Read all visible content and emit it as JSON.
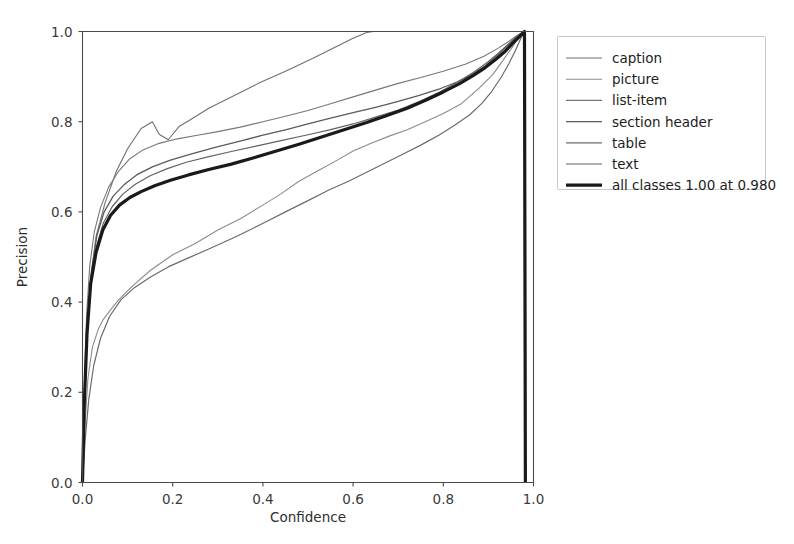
{
  "figure": {
    "background_color": "#ffffff",
    "width": 794,
    "height": 544
  },
  "axes": {
    "x_title": "Confidence",
    "y_title": "Precision",
    "x_ticks": [
      "0.0",
      "0.2",
      "0.4",
      "0.6",
      "0.8",
      "1.0"
    ],
    "y_ticks": [
      "0.0",
      "0.2",
      "0.4",
      "0.6",
      "0.8",
      "1.0"
    ]
  },
  "legend": {
    "entries": [
      {
        "label": "caption",
        "color": "#6f6f6f",
        "width": 1.1
      },
      {
        "label": "picture",
        "color": "#8c8c8c",
        "width": 1.1
      },
      {
        "label": "list-item",
        "color": "#777777",
        "width": 1.1
      },
      {
        "label": "section header",
        "color": "#5a5a5a",
        "width": 1.3
      },
      {
        "label": "table",
        "color": "#6b6b6b",
        "width": 1.2
      },
      {
        "label": "text",
        "color": "#626262",
        "width": 1.2
      },
      {
        "label": "all classes 1.00 at 0.980",
        "color": "#1a1a1a",
        "width": 3.2
      }
    ]
  },
  "chart_data": {
    "type": "line",
    "title": "",
    "xlabel": "Confidence",
    "ylabel": "Precision",
    "xlim": [
      0.0,
      1.0
    ],
    "ylim": [
      0.0,
      1.0
    ],
    "xticks": [
      0.0,
      0.2,
      0.4,
      0.6,
      0.8,
      1.0
    ],
    "yticks": [
      0.0,
      0.2,
      0.4,
      0.6,
      0.8,
      1.0
    ],
    "grid": false,
    "legend_position": "outside-right-top",
    "annotation": "all classes 1.00 at 0.980",
    "series": [
      {
        "name": "caption",
        "color": "#6f6f6f",
        "linewidth": 1.1,
        "x": [
          0.0,
          0.004,
          0.01,
          0.018,
          0.03,
          0.05,
          0.075,
          0.1,
          0.13,
          0.155,
          0.17,
          0.19,
          0.215,
          0.24,
          0.28,
          0.33,
          0.39,
          0.45,
          0.51,
          0.56,
          0.6,
          0.63,
          0.645,
          0.7,
          0.8,
          0.9,
          0.95,
          0.975,
          0.98,
          0.982
        ],
        "y": [
          0.0,
          0.18,
          0.34,
          0.45,
          0.545,
          0.62,
          0.69,
          0.74,
          0.785,
          0.8,
          0.772,
          0.76,
          0.79,
          0.805,
          0.83,
          0.855,
          0.885,
          0.912,
          0.94,
          0.965,
          0.985,
          0.998,
          1.0,
          1.0,
          1.0,
          1.0,
          1.0,
          1.0,
          1.0,
          0.0
        ]
      },
      {
        "name": "picture",
        "color": "#8c8c8c",
        "linewidth": 1.1,
        "x": [
          0.0,
          0.005,
          0.012,
          0.022,
          0.035,
          0.045,
          0.06,
          0.08,
          0.11,
          0.15,
          0.2,
          0.25,
          0.3,
          0.35,
          0.4,
          0.44,
          0.48,
          0.52,
          0.56,
          0.6,
          0.64,
          0.68,
          0.72,
          0.76,
          0.8,
          0.84,
          0.88,
          0.91,
          0.935,
          0.955,
          0.968,
          0.978,
          0.98,
          0.982
        ],
        "y": [
          0.0,
          0.12,
          0.23,
          0.3,
          0.34,
          0.36,
          0.38,
          0.405,
          0.435,
          0.47,
          0.505,
          0.53,
          0.56,
          0.585,
          0.615,
          0.64,
          0.668,
          0.69,
          0.712,
          0.735,
          0.752,
          0.768,
          0.782,
          0.8,
          0.818,
          0.84,
          0.875,
          0.905,
          0.94,
          0.968,
          0.99,
          1.0,
          1.0,
          0.0
        ]
      },
      {
        "name": "list-item",
        "color": "#777777",
        "linewidth": 1.1,
        "x": [
          0.0,
          0.004,
          0.009,
          0.016,
          0.026,
          0.04,
          0.058,
          0.08,
          0.105,
          0.135,
          0.17,
          0.21,
          0.255,
          0.3,
          0.35,
          0.4,
          0.45,
          0.5,
          0.55,
          0.6,
          0.65,
          0.7,
          0.75,
          0.8,
          0.85,
          0.89,
          0.92,
          0.945,
          0.962,
          0.975,
          0.98,
          0.982
        ],
        "y": [
          0.0,
          0.2,
          0.37,
          0.48,
          0.555,
          0.61,
          0.655,
          0.69,
          0.718,
          0.738,
          0.752,
          0.762,
          0.77,
          0.778,
          0.788,
          0.8,
          0.812,
          0.825,
          0.84,
          0.855,
          0.87,
          0.885,
          0.898,
          0.912,
          0.928,
          0.945,
          0.962,
          0.978,
          0.99,
          0.998,
          1.0,
          0.0
        ]
      },
      {
        "name": "section header",
        "color": "#5a5a5a",
        "linewidth": 1.3,
        "x": [
          0.0,
          0.005,
          0.011,
          0.02,
          0.032,
          0.048,
          0.068,
          0.092,
          0.12,
          0.155,
          0.195,
          0.24,
          0.29,
          0.345,
          0.4,
          0.45,
          0.5,
          0.55,
          0.6,
          0.65,
          0.7,
          0.745,
          0.79,
          0.83,
          0.865,
          0.895,
          0.92,
          0.942,
          0.96,
          0.974,
          0.98,
          0.982
        ],
        "y": [
          0.0,
          0.19,
          0.355,
          0.47,
          0.548,
          0.6,
          0.635,
          0.66,
          0.682,
          0.7,
          0.715,
          0.728,
          0.742,
          0.756,
          0.77,
          0.782,
          0.795,
          0.808,
          0.82,
          0.832,
          0.845,
          0.858,
          0.872,
          0.888,
          0.905,
          0.925,
          0.948,
          0.968,
          0.985,
          0.996,
          1.0,
          0.0
        ]
      },
      {
        "name": "table",
        "color": "#6b6b6b",
        "linewidth": 1.2,
        "x": [
          0.0,
          0.006,
          0.014,
          0.025,
          0.04,
          0.06,
          0.085,
          0.115,
          0.15,
          0.19,
          0.235,
          0.285,
          0.34,
          0.395,
          0.45,
          0.5,
          0.545,
          0.59,
          0.63,
          0.67,
          0.71,
          0.75,
          0.79,
          0.825,
          0.858,
          0.885,
          0.908,
          0.928,
          0.945,
          0.96,
          0.972,
          0.98,
          0.982
        ],
        "y": [
          0.0,
          0.095,
          0.185,
          0.26,
          0.32,
          0.368,
          0.405,
          0.432,
          0.455,
          0.478,
          0.498,
          0.52,
          0.545,
          0.572,
          0.6,
          0.625,
          0.648,
          0.668,
          0.688,
          0.708,
          0.728,
          0.748,
          0.77,
          0.792,
          0.815,
          0.84,
          0.868,
          0.898,
          0.928,
          0.958,
          0.985,
          1.0,
          0.0
        ]
      },
      {
        "name": "text",
        "color": "#626262",
        "linewidth": 1.2,
        "x": [
          0.0,
          0.004,
          0.01,
          0.018,
          0.03,
          0.046,
          0.066,
          0.09,
          0.118,
          0.15,
          0.188,
          0.23,
          0.278,
          0.33,
          0.385,
          0.44,
          0.495,
          0.548,
          0.6,
          0.65,
          0.7,
          0.748,
          0.792,
          0.832,
          0.868,
          0.898,
          0.922,
          0.942,
          0.958,
          0.972,
          0.98,
          0.982
        ],
        "y": [
          0.0,
          0.175,
          0.33,
          0.44,
          0.52,
          0.575,
          0.612,
          0.64,
          0.662,
          0.68,
          0.696,
          0.71,
          0.722,
          0.734,
          0.746,
          0.758,
          0.77,
          0.782,
          0.795,
          0.81,
          0.826,
          0.845,
          0.866,
          0.888,
          0.91,
          0.932,
          0.952,
          0.97,
          0.985,
          0.996,
          1.0,
          0.0
        ]
      },
      {
        "name": "all classes 1.00 at 0.980",
        "color": "#1a1a1a",
        "linewidth": 3.2,
        "x": [
          0.0,
          0.004,
          0.01,
          0.018,
          0.03,
          0.045,
          0.062,
          0.082,
          0.105,
          0.13,
          0.16,
          0.195,
          0.235,
          0.28,
          0.33,
          0.38,
          0.43,
          0.48,
          0.53,
          0.58,
          0.63,
          0.675,
          0.72,
          0.762,
          0.8,
          0.835,
          0.866,
          0.893,
          0.916,
          0.936,
          0.952,
          0.966,
          0.976,
          0.98,
          0.982
        ],
        "y": [
          0.0,
          0.175,
          0.33,
          0.44,
          0.51,
          0.56,
          0.592,
          0.615,
          0.632,
          0.645,
          0.658,
          0.67,
          0.682,
          0.694,
          0.706,
          0.72,
          0.735,
          0.75,
          0.766,
          0.782,
          0.798,
          0.814,
          0.83,
          0.848,
          0.866,
          0.884,
          0.902,
          0.92,
          0.938,
          0.955,
          0.972,
          0.986,
          0.996,
          1.0,
          0.0
        ]
      }
    ]
  }
}
